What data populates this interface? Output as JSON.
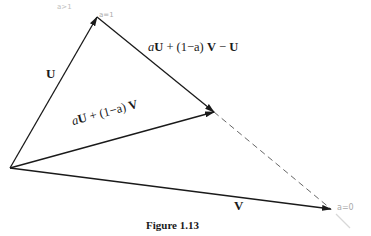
{
  "figure": {
    "caption": "Figure 1.13",
    "vectors": {
      "U": {
        "label": "U",
        "from": [
          10,
          168
        ],
        "to": [
          97,
          17
        ]
      },
      "V": {
        "label": "V",
        "from": [
          10,
          168
        ],
        "to": [
          331,
          209
        ]
      },
      "combo": {
        "label_a": "a",
        "label_U": "U",
        "label_mid": " + (1−a) ",
        "label_V": "V",
        "from": [
          10,
          168
        ],
        "to": [
          214,
          112
        ]
      },
      "diff": {
        "label_a": "a",
        "label_U": "U",
        "label_mid": " + (1−a) ",
        "label_V": "V",
        "label_minus": " − ",
        "label_U2": "U",
        "from": [
          97,
          17
        ],
        "to": [
          214,
          112
        ]
      },
      "dashed": {
        "from": [
          214,
          112
        ],
        "to": [
          331,
          209
        ]
      }
    },
    "annotations": {
      "top_faint": "a>1",
      "top_tip": "a=1",
      "right_tip": "a=0"
    },
    "colors": {
      "line": "#1a1a1a",
      "dash": "#555555",
      "annotation": "#bdbdbd"
    }
  }
}
